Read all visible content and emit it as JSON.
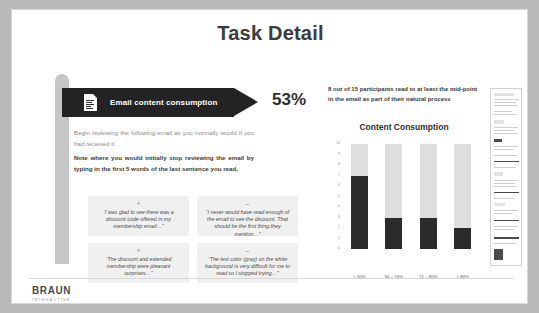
{
  "slide": {
    "title": "Task Detail"
  },
  "banner": {
    "icon": "document-icon",
    "label": "Email content consumption",
    "percentage": "53%"
  },
  "instructions": {
    "paragraph_1": "Begin reviewing the following email as you normally would if you had received it.",
    "paragraph_2": "Note where you would initially stop reviewing the email by typing in the first 5 words of the last sentence you read."
  },
  "quotes": [
    {
      "sentiment": "positive",
      "sign": "+",
      "text": "“I was glad to see there was a discount code offered in my membership email…”"
    },
    {
      "sentiment": "negative",
      "sign": "–",
      "text": "“I never would have read enough of the email to see the discount. That should be the first thing they mention…”"
    },
    {
      "sentiment": "positive",
      "sign": "+",
      "text": "“The discount and extended membership were pleasant surprises…”"
    },
    {
      "sentiment": "negative",
      "sign": "–",
      "text": "“The text color (gray) on the white background is very difficult for me to read so I stopped trying…”"
    }
  ],
  "callout": {
    "text": "8 out of 15 participants read to at least the mid-point in the email as part of their natural process"
  },
  "chart_data": {
    "type": "bar",
    "title": "Content Consumption",
    "xlabel": "",
    "ylabel": "",
    "categories": [
      "< 50%",
      "50 – 70%",
      "71 – 80%",
      "> 80%"
    ],
    "values": [
      7,
      3,
      3,
      2
    ],
    "series": [
      {
        "name": "Participants",
        "values": [
          7,
          3,
          3,
          2
        ],
        "color": "#2b2b2b"
      },
      {
        "name": "Remainder",
        "values": [
          3,
          7,
          7,
          8
        ],
        "color": "#dedede"
      }
    ],
    "ylim": [
      0,
      10
    ],
    "yticks": [
      "0",
      "1",
      "2",
      "3",
      "4",
      "5",
      "6",
      "7",
      "8",
      "9",
      "10"
    ],
    "stacked": true,
    "grid": false,
    "legend": "none"
  },
  "thumbnail": {
    "name": "email-preview-thumbnail"
  },
  "footer": {
    "logo_main": "BRAUN",
    "logo_sub": "INTERACTIVE"
  }
}
